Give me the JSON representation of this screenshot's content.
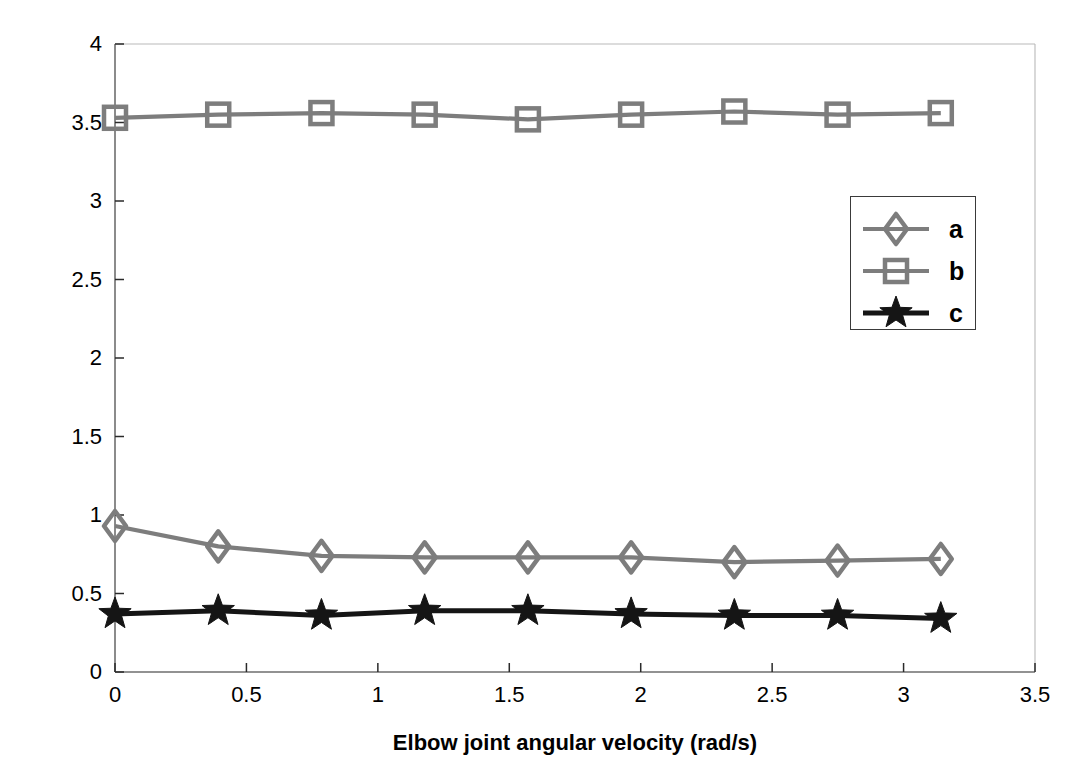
{
  "chart_data": {
    "type": "line",
    "title": "",
    "xlabel": "Elbow joint angular velocity (rad/s)",
    "ylabel": "Values of the parameters a, b, c",
    "xlim": [
      0,
      3.5
    ],
    "ylim": [
      0,
      4
    ],
    "xticks": [
      "0",
      "0.5",
      "1",
      "1.5",
      "2",
      "2.5",
      "3",
      "3.5"
    ],
    "xtick_values": [
      0,
      0.5,
      1,
      1.5,
      2,
      2.5,
      3,
      3.5
    ],
    "yticks": [
      "0",
      "0.5",
      "1",
      "1.5",
      "2",
      "2.5",
      "3",
      "3.5",
      "4"
    ],
    "ytick_values": [
      0,
      0.5,
      1,
      1.5,
      2,
      2.5,
      3,
      3.5,
      4
    ],
    "grid": false,
    "legend_position": "center-right",
    "x": [
      0,
      0.3927,
      0.7854,
      1.1781,
      1.5708,
      1.9635,
      2.3562,
      2.7489,
      3.1416
    ],
    "series": [
      {
        "name": "a",
        "marker": "diamond",
        "color": "#7d7d7d",
        "values": [
          0.93,
          0.8,
          0.74,
          0.73,
          0.73,
          0.73,
          0.7,
          0.71,
          0.72
        ]
      },
      {
        "name": "b",
        "marker": "square",
        "color": "#7d7d7d",
        "values": [
          3.53,
          3.55,
          3.56,
          3.55,
          3.52,
          3.55,
          3.57,
          3.55,
          3.56
        ]
      },
      {
        "name": "c",
        "marker": "star",
        "color": "#151515",
        "values": [
          0.37,
          0.39,
          0.36,
          0.39,
          0.39,
          0.37,
          0.36,
          0.36,
          0.34
        ]
      }
    ]
  },
  "legend": {
    "entries": [
      {
        "label": "a"
      },
      {
        "label": "b"
      },
      {
        "label": "c"
      }
    ]
  },
  "colors": {
    "series_gray": "#7d7d7d",
    "series_black": "#151515",
    "axis": "#6e6e6e",
    "text": "#000000"
  }
}
